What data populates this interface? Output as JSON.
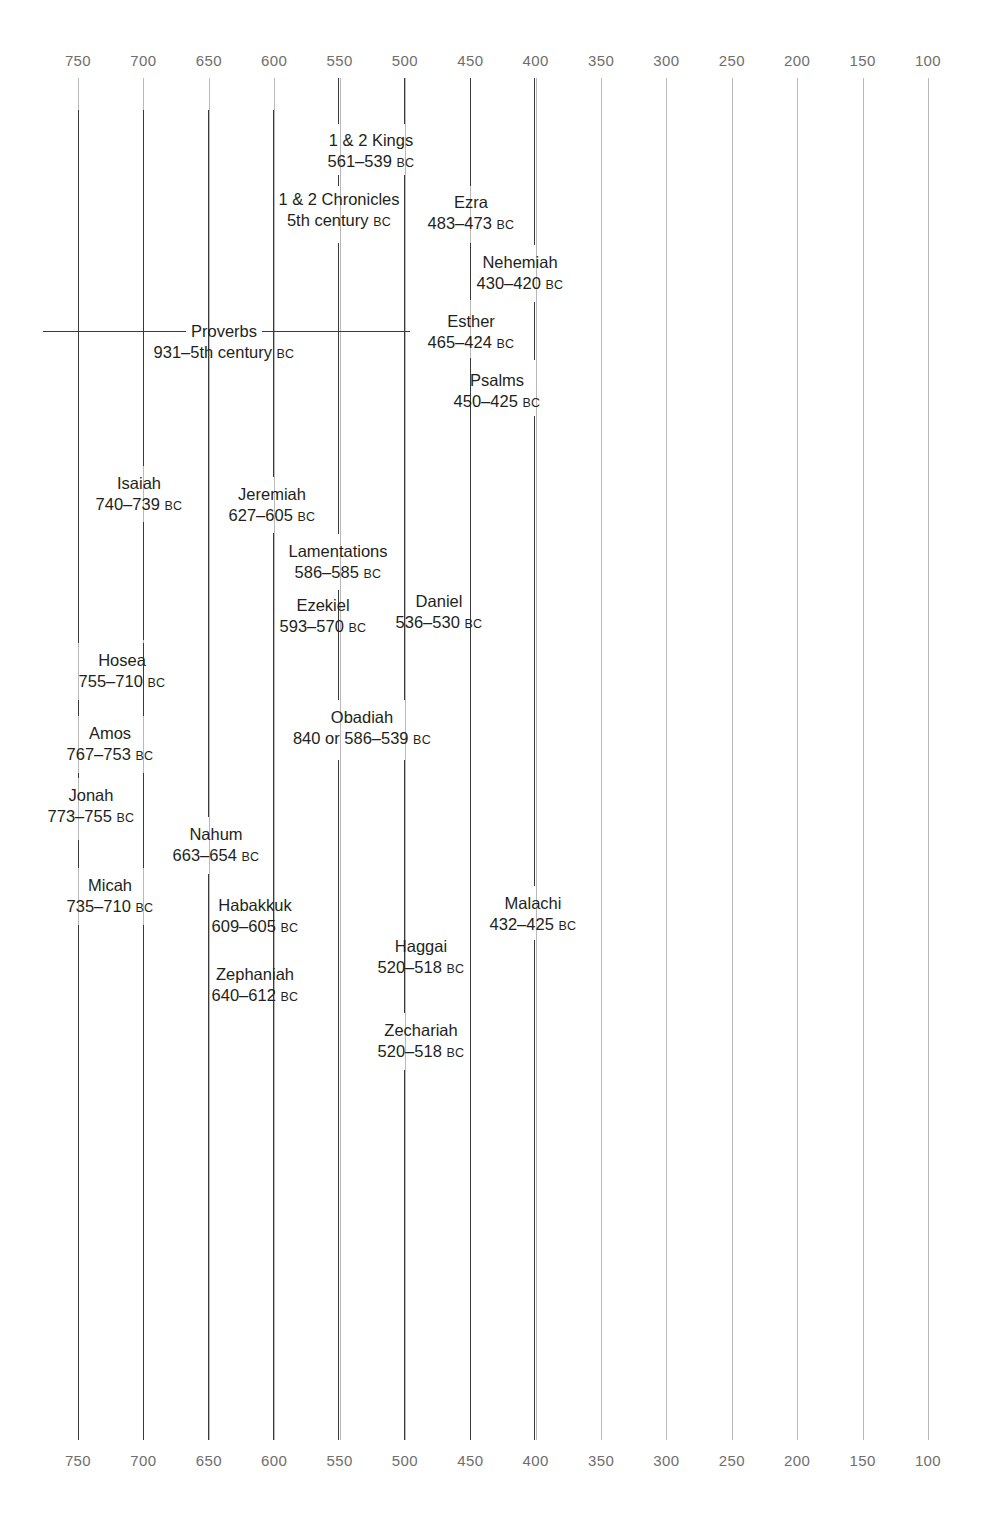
{
  "chart_data": {
    "type": "table",
    "xlabel": "",
    "ylabel": "",
    "xlim": [
      780,
      85
    ],
    "axis_direction": "descending",
    "grid": true,
    "legend": false,
    "era_suffix": "BC",
    "tick_labels": [
      "750",
      "700",
      "650",
      "600",
      "550",
      "500",
      "450",
      "400",
      "350",
      "300",
      "250",
      "200",
      "150",
      "100"
    ],
    "tick_values": [
      750,
      700,
      650,
      600,
      550,
      500,
      450,
      400,
      350,
      300,
      250,
      200,
      150,
      100
    ],
    "axes_shown": [
      "top",
      "bottom"
    ],
    "categories": [
      "1 & 2 Kings",
      "1 & 2 Chronicles",
      "Ezra",
      "Nehemiah",
      "Esther",
      "Proverbs",
      "Psalms",
      "Isaiah",
      "Jeremiah",
      "Lamentations",
      "Ezekiel",
      "Daniel",
      "Hosea",
      "Amos",
      "Jonah",
      "Obadiah",
      "Nahum",
      "Micah",
      "Habakkuk",
      "Malachi",
      "Zephaniah",
      "Haggai",
      "Zechariah"
    ],
    "entries": [
      {
        "name": "1 & 2 Kings",
        "dates": "561–539",
        "era": "BC",
        "start": 561,
        "end": 539
      },
      {
        "name": "1 & 2 Chronicles",
        "dates": "5th century",
        "era": "BC",
        "start": 500,
        "end": 400
      },
      {
        "name": "Ezra",
        "dates": "483–473",
        "era": "BC",
        "start": 483,
        "end": 473
      },
      {
        "name": "Nehemiah",
        "dates": "430–420",
        "era": "BC",
        "start": 430,
        "end": 420
      },
      {
        "name": "Esther",
        "dates": "465–424",
        "era": "BC",
        "start": 465,
        "end": 424
      },
      {
        "name": "Proverbs",
        "dates": "931–5th century",
        "era": "BC",
        "start": 931,
        "end": 450
      },
      {
        "name": "Psalms",
        "dates": "450–425",
        "era": "BC",
        "start": 450,
        "end": 425
      },
      {
        "name": "Isaiah",
        "dates": "740–739",
        "era": "BC",
        "start": 740,
        "end": 739
      },
      {
        "name": "Jeremiah",
        "dates": "627–605",
        "era": "BC",
        "start": 627,
        "end": 605
      },
      {
        "name": "Lamentations",
        "dates": "586–585",
        "era": "BC",
        "start": 586,
        "end": 585
      },
      {
        "name": "Ezekiel",
        "dates": "593–570",
        "era": "BC",
        "start": 593,
        "end": 570
      },
      {
        "name": "Daniel",
        "dates": "536–530",
        "era": "BC",
        "start": 536,
        "end": 530
      },
      {
        "name": "Hosea",
        "dates": "755–710",
        "era": "BC",
        "start": 755,
        "end": 710
      },
      {
        "name": "Amos",
        "dates": "767–753",
        "era": "BC",
        "start": 767,
        "end": 753
      },
      {
        "name": "Jonah",
        "dates": "773–755",
        "era": "BC",
        "start": 773,
        "end": 755
      },
      {
        "name": "Obadiah",
        "dates": "840 or 586–539",
        "era": "BC",
        "start": 586,
        "end": 539
      },
      {
        "name": "Nahum",
        "dates": "663–654",
        "era": "BC",
        "start": 663,
        "end": 654
      },
      {
        "name": "Micah",
        "dates": "735–710",
        "era": "BC",
        "start": 735,
        "end": 710
      },
      {
        "name": "Habakkuk",
        "dates": "609–605",
        "era": "BC",
        "start": 609,
        "end": 605
      },
      {
        "name": "Malachi",
        "dates": "432–425",
        "era": "BC",
        "start": 432,
        "end": 425
      },
      {
        "name": "Zephaniah",
        "dates": "640–612",
        "era": "BC",
        "start": 640,
        "end": 612
      },
      {
        "name": "Haggai",
        "dates": "520–518",
        "era": "BC",
        "start": 520,
        "end": 518
      },
      {
        "name": "Zechariah",
        "dates": "520–518",
        "era": "BC",
        "start": 520,
        "end": 518
      }
    ]
  },
  "colors": {
    "background": "#ffffff",
    "gridline": "#b9b9b9",
    "tick_text": "#6e6e6e",
    "bracket": "#3a3a3a",
    "label_text": "#231f20"
  }
}
